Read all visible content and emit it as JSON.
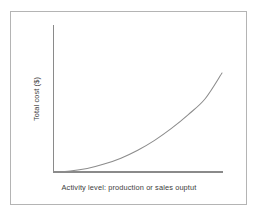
{
  "figure": {
    "background_color": "#ffffff",
    "frame_color": "#b4b4b4",
    "axis_color": "#8a8a8a",
    "curve_color": "#8c8c8c",
    "label_color": "#3c3c3c"
  },
  "chart_data": {
    "type": "line",
    "title": "",
    "subtitle": "",
    "xlabel": "Activity level: production or sales ouptut",
    "ylabel": "Total cost ($)",
    "grid": false,
    "legend": null,
    "xlim": [
      0,
      100
    ],
    "ylim": [
      0,
      100
    ],
    "xticks": [],
    "yticks": [],
    "xticklabels": [],
    "yticklabels": [],
    "annotations": [],
    "series": [
      {
        "name": "Total cost",
        "shape": "convex-increasing",
        "x": [
          0,
          10,
          20,
          30,
          40,
          50,
          60,
          70,
          80,
          90,
          100
        ],
        "y": [
          0,
          1,
          3.5,
          8,
          14,
          22,
          32,
          44,
          58,
          74,
          100
        ]
      }
    ]
  }
}
